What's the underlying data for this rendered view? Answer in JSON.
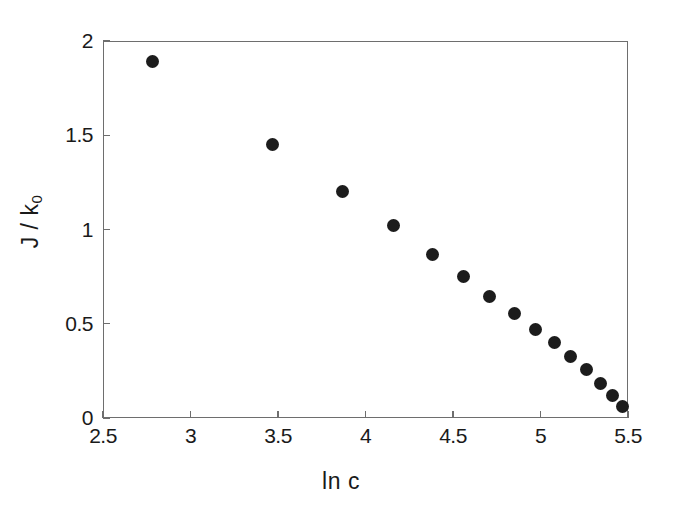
{
  "chart_data": {
    "type": "scatter",
    "title": "",
    "xlabel": "ln c",
    "ylabel": "J / k",
    "ylabel_subscript": "0",
    "xlim": [
      2.5,
      5.5
    ],
    "ylim": [
      0,
      2
    ],
    "xticks": [
      2.5,
      3,
      3.5,
      4,
      4.5,
      5,
      5.5
    ],
    "xtick_labels": [
      "2.5",
      "3",
      "3.5",
      "4",
      "4.5",
      "5",
      "5.5"
    ],
    "yticks": [
      0,
      0.5,
      1,
      1.5,
      2
    ],
    "ytick_labels": [
      "0",
      "0.5",
      "1",
      "1.5",
      "2"
    ],
    "grid": false,
    "legend": false,
    "marker": "filled-circle",
    "marker_color": "#1c1c1c",
    "marker_size_px": 13,
    "frame_color": "#6e6e6e",
    "background": "#ffffff",
    "series": [
      {
        "name": "J/k0 vs ln c",
        "points": [
          {
            "x": 2.78,
            "y": 1.89
          },
          {
            "x": 3.47,
            "y": 1.45
          },
          {
            "x": 3.87,
            "y": 1.2
          },
          {
            "x": 4.16,
            "y": 1.02
          },
          {
            "x": 4.38,
            "y": 0.87
          },
          {
            "x": 4.56,
            "y": 0.75
          },
          {
            "x": 4.71,
            "y": 0.645
          },
          {
            "x": 4.85,
            "y": 0.555
          },
          {
            "x": 4.97,
            "y": 0.47
          },
          {
            "x": 5.08,
            "y": 0.4
          },
          {
            "x": 5.17,
            "y": 0.325
          },
          {
            "x": 5.26,
            "y": 0.255
          },
          {
            "x": 5.34,
            "y": 0.185
          },
          {
            "x": 5.41,
            "y": 0.12
          },
          {
            "x": 5.47,
            "y": 0.06
          }
        ]
      }
    ]
  }
}
